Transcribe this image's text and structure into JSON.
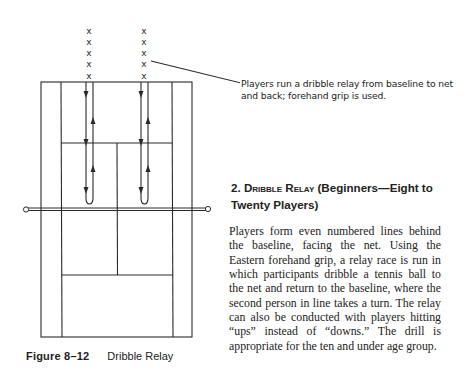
{
  "figure": {
    "number": "Figure 8–12",
    "title": "Dribble Relay",
    "callout": "Players run a dribble relay from baseline to net and back; forehand grip is used.",
    "player_marker": "X",
    "lines": [
      {
        "x_label": "left line",
        "players": 5
      },
      {
        "x_label": "right line",
        "players": 5
      }
    ],
    "icons": [
      "player-x-icon",
      "arrow-down-icon",
      "arrow-up-icon",
      "net-post-icon"
    ]
  },
  "section": {
    "number": "2.",
    "name": "Dribble Relay",
    "qualifier": "(Beginners—Eight to Twenty Players)",
    "body": "Players form even numbered lines behind the baseline, facing the net. Using the Eastern forehand grip, a relay race is run in which participants dribble a tennis ball to the net and return to the baseline, where the second person in line takes a turn. The relay can also be conducted with players hitting “ups” instead of “downs.” The drill is appropriate for the ten and under age group."
  }
}
